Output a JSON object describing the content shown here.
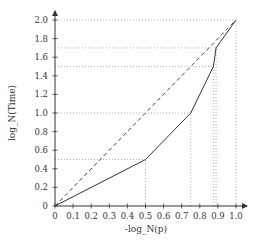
{
  "chart_data": {
    "type": "line",
    "title": "",
    "xlabel": "-log_N(p)",
    "ylabel": "log_N(Time)",
    "xlim": [
      0,
      1.0
    ],
    "ylim": [
      0,
      2.0
    ],
    "x_ticks": [
      "0",
      "0.1",
      "0.2",
      "0.3",
      "0.4",
      "0.5",
      "0.6",
      "0.7",
      "0.8",
      "0.9",
      "1.0"
    ],
    "y_ticks": [
      "0",
      "0.2",
      "0.4",
      "0.6",
      "0.8",
      "1.0",
      "1.2",
      "1.4",
      "1.6",
      "1.8",
      "2.0"
    ],
    "grid": false,
    "series": [
      {
        "name": "piecewise",
        "style": "solid",
        "color": "#333333",
        "x": [
          0,
          0.5,
          0.75,
          0.875,
          0.89,
          1.0
        ],
        "y": [
          0,
          0.5,
          1.0,
          1.5,
          1.7,
          2.0
        ]
      },
      {
        "name": "diagonal",
        "style": "dashed",
        "color": "#444444",
        "x": [
          0,
          1.0
        ],
        "y": [
          0,
          2.0
        ]
      }
    ],
    "guide_lines": {
      "style": "dotted",
      "color": "#9a9a9a",
      "points": [
        {
          "x": 0.5,
          "y": 0.5
        },
        {
          "x": 0.75,
          "y": 1.0
        },
        {
          "x": 0.875,
          "y": 1.5
        },
        {
          "x": 0.89,
          "y": 1.7
        },
        {
          "x": 1.0,
          "y": 2.0
        }
      ]
    }
  }
}
